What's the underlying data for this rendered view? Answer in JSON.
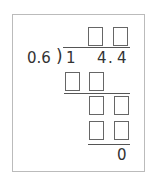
{
  "problem": {
    "divisor": "0.6",
    "bracket": ")",
    "dividend_digits": [
      "1",
      "4",
      ".",
      "4"
    ],
    "remainder": "0"
  },
  "answer_boxes": {
    "quotient": [
      "",
      ""
    ],
    "step1": [
      "",
      ""
    ],
    "step2": [
      "",
      ""
    ],
    "step3": [
      "",
      ""
    ]
  }
}
